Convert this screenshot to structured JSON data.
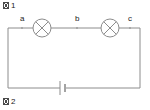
{
  "figure_top": {
    "missing_glyph": "☒",
    "number": "1",
    "text": "1"
  },
  "figure_bottom": {
    "missing_glyph": "☒",
    "number": "2",
    "text": "2"
  },
  "colors": {
    "wire": "#8c8c8c",
    "component": "#8c8c8c",
    "text": "#1a1a1a",
    "background": "#ffffff",
    "node_dot": "#9a9a9a"
  },
  "circuit": {
    "type": "series-circuit",
    "loop": {
      "left_x": 8,
      "right_x": 140,
      "top_y": 28,
      "bottom_y": 88
    },
    "nodes": [
      {
        "label": "a",
        "x": 22,
        "y": 28,
        "label_x": 20,
        "label_y": 21
      },
      {
        "label": "b",
        "x": 77,
        "y": 28,
        "label_x": 75,
        "label_y": 21
      },
      {
        "label": "c",
        "x": 130,
        "y": 28,
        "label_x": 128,
        "label_y": 21
      }
    ],
    "lamps": [
      {
        "name": "lamp-1",
        "cx": 42,
        "cy": 28,
        "r": 9
      },
      {
        "name": "lamp-2",
        "cx": 110,
        "cy": 28,
        "r": 9
      }
    ],
    "cell": {
      "name": "battery-cell",
      "x": 62,
      "y": 88,
      "long_plate_half_height": 7,
      "short_plate_half_height": 4,
      "plate_gap": 4
    }
  }
}
